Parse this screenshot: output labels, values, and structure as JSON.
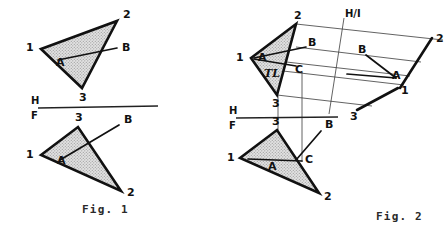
{
  "meta": {
    "background_color": "#ffffff",
    "ink_color": "#111111",
    "fill_color": "#d2d2d2"
  },
  "captions": {
    "fig1": "Fig. 1",
    "fig2": "Fig. 2"
  },
  "figure1": {
    "name": "Fig. 1",
    "reference_line": {
      "upper_label": "H",
      "lower_label": "F",
      "name": "h-f-fold-line"
    },
    "top_view": {
      "name": "horizontal-projection",
      "vertices": [
        {
          "label": "1",
          "x": 41,
          "y": 49
        },
        {
          "label": "2",
          "x": 117,
          "y": 21
        },
        {
          "label": "3",
          "x": 82,
          "y": 88
        }
      ],
      "points": [
        {
          "label": "A",
          "x": 62,
          "y": 57
        },
        {
          "label": "B",
          "x": 122,
          "y": 48
        }
      ]
    },
    "front_view": {
      "name": "frontal-projection",
      "vertices": [
        {
          "label": "1",
          "x": 41,
          "y": 155
        },
        {
          "label": "2",
          "x": 121,
          "y": 191
        },
        {
          "label": "3",
          "x": 78,
          "y": 127
        }
      ],
      "points": [
        {
          "label": "A",
          "x": 64,
          "y": 157
        },
        {
          "label": "B",
          "x": 123,
          "y": 127
        }
      ]
    }
  },
  "figure2": {
    "name": "Fig. 2",
    "reference_lines": [
      {
        "upper_label": "H",
        "lower_label": "F",
        "name": "h-f-fold-line"
      },
      {
        "label": "H/I",
        "name": "h-1-fold-line"
      }
    ],
    "top_view": {
      "name": "horizontal-projection",
      "vertices": [
        {
          "label": "1",
          "x": 251,
          "y": 58
        },
        {
          "label": "2",
          "x": 296,
          "y": 24
        },
        {
          "label": "3",
          "x": 277,
          "y": 95
        }
      ],
      "points": [
        {
          "label": "A",
          "x": 261,
          "y": 59
        },
        {
          "label": "B",
          "x": 311,
          "y": 47
        },
        {
          "label": "C",
          "x": 297,
          "y": 70
        },
        {
          "label": "TL",
          "x": 271,
          "y": 73
        }
      ]
    },
    "front_view": {
      "name": "frontal-projection",
      "vertices": [
        {
          "label": "1",
          "x": 240,
          "y": 158
        },
        {
          "label": "2",
          "x": 319,
          "y": 193
        },
        {
          "label": "3",
          "x": 277,
          "y": 130
        }
      ],
      "points": [
        {
          "label": "A",
          "x": 276,
          "y": 165
        },
        {
          "label": "B",
          "x": 324,
          "y": 129
        },
        {
          "label": "C",
          "x": 305,
          "y": 160
        }
      ]
    },
    "auxiliary_view": {
      "name": "auxiliary-projection-1",
      "vertices": [
        {
          "label": "1",
          "x": 403,
          "y": 84
        },
        {
          "label": "2",
          "x": 432,
          "y": 38
        },
        {
          "label": "3",
          "x": 354,
          "y": 111
        }
      ],
      "points": [
        {
          "label": "A",
          "x": 396,
          "y": 76
        },
        {
          "label": "B",
          "x": 362,
          "y": 53
        }
      ]
    }
  },
  "annotations": {
    "true_length_marker": "TL",
    "fold_h": "H",
    "fold_f": "F",
    "fold_h1": "H/I"
  }
}
